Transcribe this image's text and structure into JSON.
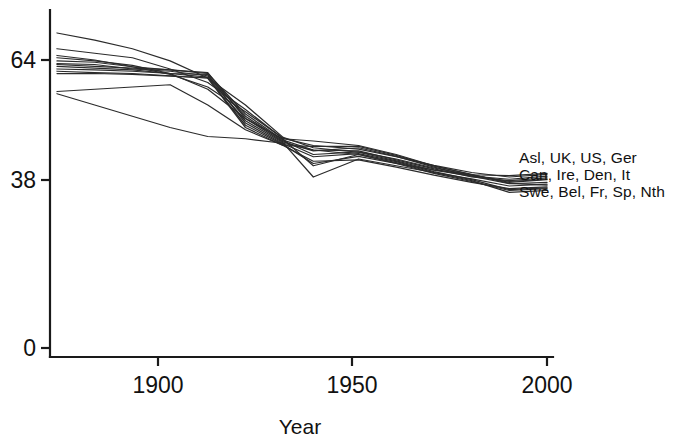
{
  "chart_data": {
    "type": "line",
    "title": "",
    "subtitle": "",
    "xlabel": "Year",
    "ylabel": "",
    "xlim": [
      1870,
      2000
    ],
    "ylim": [
      0,
      72
    ],
    "xticks": [
      1900,
      1950,
      2000
    ],
    "xtick_labels": [
      "1900",
      "1950",
      "2000"
    ],
    "yticks": [
      0,
      38,
      64
    ],
    "ytick_labels": [
      "0",
      "38",
      "64"
    ],
    "grid": false,
    "legend_position": "right-inline",
    "annotations": [
      "Asl, UK, US, Ger",
      "Can, Ire, Den, It",
      "Swe, Bel, Fr, Sp, Nth"
    ],
    "x": [
      1870,
      1880,
      1890,
      1900,
      1910,
      1920,
      1930,
      1938,
      1950,
      1960,
      1970,
      1980,
      1990,
      2000
    ],
    "series": [
      {
        "name": "Asl",
        "values": [
          70.0,
          68.4,
          66.5,
          63.8,
          60.0,
          54.0,
          46.8,
          44.5,
          43.5,
          41.6,
          39.5,
          38.2,
          37.5,
          38.2
        ]
      },
      {
        "name": "UK",
        "values": [
          65.0,
          64.0,
          62.5,
          60.8,
          58.0,
          52.5,
          46.6,
          45.0,
          44.2,
          42.5,
          40.6,
          39.0,
          38.0,
          38.6
        ]
      },
      {
        "name": "US",
        "values": [
          64.5,
          63.8,
          62.8,
          61.0,
          57.5,
          51.0,
          46.4,
          40.5,
          43.0,
          41.0,
          39.6,
          38.5,
          38.3,
          38.8
        ]
      },
      {
        "name": "Ger",
        "values": [
          66.5,
          65.5,
          64.5,
          62.0,
          59.0,
          53.0,
          46.5,
          46.0,
          45.0,
          43.0,
          40.5,
          38.5,
          36.8,
          37.4
        ]
      },
      {
        "name": "Can",
        "values": [
          63.8,
          63.5,
          62.5,
          61.8,
          61.0,
          52.0,
          46.2,
          44.0,
          43.8,
          41.8,
          39.8,
          38.0,
          37.2,
          37.8
        ]
      },
      {
        "name": "Ire",
        "values": [
          63.2,
          63.0,
          62.0,
          61.5,
          60.5,
          51.5,
          46.0,
          43.0,
          43.6,
          42.0,
          40.0,
          38.4,
          37.0,
          37.5
        ]
      },
      {
        "name": "Den",
        "values": [
          63.0,
          62.6,
          62.2,
          61.8,
          61.2,
          51.0,
          45.8,
          43.8,
          44.5,
          42.6,
          40.2,
          38.2,
          36.5,
          36.8
        ]
      },
      {
        "name": "It",
        "values": [
          62.6,
          62.2,
          61.8,
          61.0,
          60.2,
          50.5,
          45.6,
          38.0,
          42.0,
          40.5,
          39.0,
          37.6,
          36.0,
          36.4
        ]
      },
      {
        "name": "Swe",
        "values": [
          62.0,
          61.8,
          61.5,
          61.0,
          60.8,
          50.0,
          45.4,
          42.5,
          43.2,
          41.4,
          39.2,
          37.4,
          35.2,
          35.6
        ]
      },
      {
        "name": "Bel",
        "values": [
          61.5,
          61.2,
          61.0,
          60.5,
          60.0,
          49.5,
          45.2,
          41.0,
          42.6,
          41.0,
          38.8,
          37.0,
          35.0,
          35.4
        ]
      },
      {
        "name": "Fr",
        "values": [
          61.0,
          61.0,
          60.8,
          60.4,
          60.0,
          49.0,
          45.0,
          41.5,
          41.8,
          40.2,
          38.4,
          36.8,
          35.4,
          35.8
        ]
      },
      {
        "name": "Sp",
        "values": [
          57.0,
          57.5,
          58.0,
          58.5,
          54.0,
          48.5,
          45.0,
          44.8,
          44.8,
          42.8,
          40.4,
          38.6,
          36.6,
          36.2
        ]
      },
      {
        "name": "Nth",
        "values": [
          56.5,
          54.0,
          51.5,
          49.0,
          47.0,
          46.5,
          45.5,
          44.0,
          43.0,
          41.2,
          39.0,
          37.2,
          34.6,
          35.0
        ]
      }
    ]
  },
  "figure": {
    "xlabel": "Year",
    "ytick_0": "0",
    "ytick_38": "38",
    "ytick_64": "64",
    "xtick_1900": "1900",
    "xtick_1950": "1950",
    "xtick_2000": "2000",
    "label_line_1": "Asl, UK, US, Ger",
    "label_line_2": "Can, Ire, Den, It",
    "label_line_3": "Swe, Bel, Fr, Sp, Nth",
    "line_color": "#2b2b2b",
    "axis_color": "#1a1a1a",
    "background_color": "#ffffff"
  }
}
